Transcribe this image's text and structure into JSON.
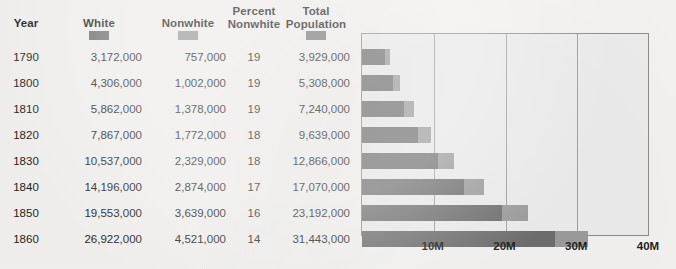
{
  "table": {
    "headers": [
      {
        "name": "year",
        "line1": "Year",
        "line2": ""
      },
      {
        "name": "white",
        "line1": "White",
        "line2": ""
      },
      {
        "name": "nonwhite",
        "line1": "Nonwhite",
        "line2": ""
      },
      {
        "name": "percent-nonwhite",
        "line1": "Percent",
        "line2": "Nonwhite"
      },
      {
        "name": "total-population",
        "line1": "Total",
        "line2": "Population"
      }
    ],
    "legend_swatches": [
      {
        "column": "white",
        "color": "#6e6e6e"
      },
      {
        "column": "nonwhite",
        "color": "#9b9b9b"
      },
      {
        "column": "total-population",
        "color": "#7d7d7d"
      }
    ],
    "rows": [
      {
        "year": "1790",
        "white": "3,172,000",
        "nonwhite": "757,000",
        "percent_nonwhite": "19",
        "total": "3,929,000"
      },
      {
        "year": "1800",
        "white": "4,306,000",
        "nonwhite": "1,002,000",
        "percent_nonwhite": "19",
        "total": "5,308,000"
      },
      {
        "year": "1810",
        "white": "5,862,000",
        "nonwhite": "1,378,000",
        "percent_nonwhite": "19",
        "total": "7,240,000"
      },
      {
        "year": "1820",
        "white": "7,867,000",
        "nonwhite": "1,772,000",
        "percent_nonwhite": "18",
        "total": "9,639,000"
      },
      {
        "year": "1830",
        "white": "10,537,000",
        "nonwhite": "2,329,000",
        "percent_nonwhite": "18",
        "total": "12,866,000"
      },
      {
        "year": "1840",
        "white": "14,196,000",
        "nonwhite": "2,874,000",
        "percent_nonwhite": "17",
        "total": "17,070,000"
      },
      {
        "year": "1850",
        "white": "19,553,000",
        "nonwhite": "3,639,000",
        "percent_nonwhite": "16",
        "total": "23,192,000"
      },
      {
        "year": "1860",
        "white": "26,922,000",
        "nonwhite": "4,521,000",
        "percent_nonwhite": "14",
        "total": "31,443,000"
      }
    ]
  },
  "chart_data": {
    "type": "bar",
    "orientation": "horizontal",
    "stacked": true,
    "title": "",
    "xlabel": "",
    "ylabel": "",
    "xlim": [
      0,
      40000000
    ],
    "xticks": [
      0,
      10000000,
      20000000,
      30000000,
      40000000
    ],
    "xtick_labels": [
      "",
      "10M",
      "20M",
      "30M",
      "40M"
    ],
    "grid": true,
    "grid_axis": "x",
    "legend_position": "table-header",
    "categories": [
      "1790",
      "1800",
      "1810",
      "1820",
      "1830",
      "1840",
      "1850",
      "1860"
    ],
    "series": [
      {
        "name": "White",
        "color": "#6e6e6e",
        "values": [
          3172000,
          4306000,
          5862000,
          7867000,
          10537000,
          14196000,
          19553000,
          26922000
        ]
      },
      {
        "name": "Nonwhite",
        "color": "#9b9b9b",
        "values": [
          757000,
          1002000,
          1378000,
          1772000,
          2329000,
          2874000,
          3639000,
          4521000
        ]
      }
    ],
    "totals": [
      3929000,
      5308000,
      7240000,
      9639000,
      12866000,
      17070000,
      23192000,
      31443000
    ],
    "plot_background": "#ececec",
    "frame_color": "#8d8d8d"
  }
}
